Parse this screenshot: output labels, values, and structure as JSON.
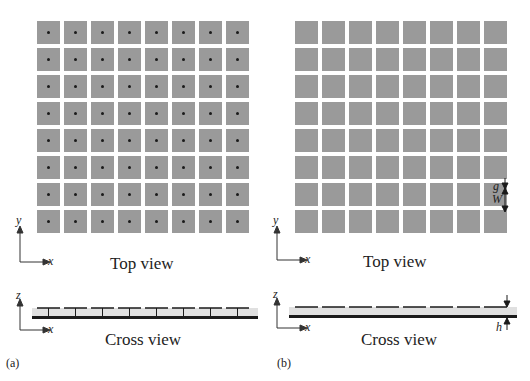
{
  "figure": {
    "panels": [
      {
        "tag": "(a)",
        "top_view_label": "Top view",
        "cross_view_label": "Cross view",
        "top_axes": {
          "vertical": "y",
          "horizontal": "x"
        },
        "cross_axes": {
          "vertical": "z",
          "horizontal": "x"
        },
        "grid": {
          "rows": 8,
          "cols": 8,
          "via_dots": true
        },
        "cross_section": {
          "patches": 8,
          "vias": 8
        }
      },
      {
        "tag": "(b)",
        "top_view_label": "Top view",
        "cross_view_label": "Cross view",
        "top_axes": {
          "vertical": "y",
          "horizontal": "x"
        },
        "cross_axes": {
          "vertical": "z",
          "horizontal": "x"
        },
        "grid": {
          "rows": 8,
          "cols": 8,
          "via_dots": false
        },
        "cross_section": {
          "patches": 8,
          "vias": 0
        },
        "dimensions": {
          "gap": "g",
          "width": "W",
          "height": "h"
        }
      }
    ],
    "colors": {
      "patch": "#9a9a9a",
      "substrate": "#e0e0e0",
      "ground": "#1a1a1a",
      "via": "#1a1a1a"
    }
  }
}
